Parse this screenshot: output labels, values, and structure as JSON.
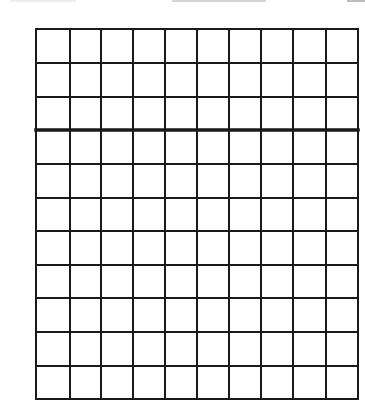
{
  "canvas": {
    "width": 365,
    "height": 420,
    "background": "#ffffff"
  },
  "top_remnants": [
    {
      "x": 10,
      "width": 66,
      "color": "#ececec"
    },
    {
      "x": 172,
      "width": 94,
      "color": "#d4d4d4"
    },
    {
      "x": 347,
      "width": 18,
      "color": "#bdbdbd"
    }
  ],
  "grid": {
    "columns": 10,
    "rows": 11,
    "left": 36,
    "top": 29,
    "right": 358,
    "bottom": 399,
    "line_color": "#1a1a1a",
    "line_width": 2,
    "thick_line_width": 3.5,
    "thick_line_after_row": 3,
    "column_lines_x": [
      36,
      70,
      101,
      133,
      165,
      197,
      229,
      261,
      293,
      326,
      358
    ],
    "row_lines_y": [
      29,
      63,
      97,
      130,
      164,
      198,
      231,
      265,
      298,
      332,
      366,
      399
    ]
  }
}
